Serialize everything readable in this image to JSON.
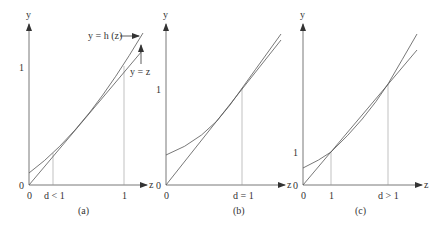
{
  "panels": [
    {
      "id": "a",
      "caption": "(a)",
      "y_axis_label": "y",
      "x_axis_label": "z",
      "origin_label_y": "0",
      "origin_label_x": "0",
      "y_tick_label": "1",
      "x_tick_labels": [
        "d < 1",
        "1"
      ],
      "curve_labels": [
        "y = h (z)",
        "y = z"
      ]
    },
    {
      "id": "b",
      "caption": "(b)",
      "y_axis_label": "y",
      "x_axis_label": "z",
      "origin_label_y": "0",
      "origin_label_x": "0",
      "y_tick_label": "1",
      "x_tick_labels": [
        "d = 1"
      ]
    },
    {
      "id": "c",
      "caption": "(c)",
      "y_axis_label": "y",
      "x_axis_label": "z",
      "origin_label_y": "0",
      "origin_label_x": "0",
      "y_tick_label": "1",
      "x_tick_labels": [
        "1",
        "d > 1"
      ]
    }
  ],
  "colors": {
    "line": "#555555",
    "text": "#333333",
    "guide": "#999999"
  }
}
